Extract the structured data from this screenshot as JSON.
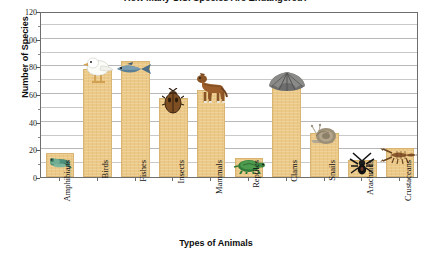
{
  "chart_data": {
    "type": "bar",
    "title": "How Many U.S. Species Are Endangered?",
    "xlabel": "Types of Animals",
    "ylabel": "Number of Species",
    "categories": [
      "Amphibians",
      "Birds",
      "Fishes",
      "Insects",
      "Mammals",
      "Reptiles",
      "Clams",
      "Snails",
      "Arachnids",
      "Crustaceans"
    ],
    "values": [
      17,
      78,
      84,
      57,
      63,
      14,
      70,
      32,
      12,
      21
    ],
    "ylim": [
      0,
      120
    ],
    "y_major_ticks": [
      0,
      20,
      40,
      60,
      80,
      100,
      120
    ],
    "y_tick_labels": [
      "0",
      "20",
      "40",
      "60",
      "80",
      "100",
      "120"
    ],
    "y_minor_tick_step": 10,
    "grid": "horizontal",
    "legend": "none",
    "bar_color": "#ecc987",
    "bar_edge_color": "#d9b573",
    "gridline_color": "#c9c9c9",
    "axis_color": "#6e6e6e",
    "background_color": "#ffffff",
    "icons": [
      {
        "category": "Amphibians",
        "icon_name": "frog-icon"
      },
      {
        "category": "Birds",
        "icon_name": "bird-icon"
      },
      {
        "category": "Fishes",
        "icon_name": "fish-icon"
      },
      {
        "category": "Insects",
        "icon_name": "beetle-icon"
      },
      {
        "category": "Mammals",
        "icon_name": "horse-icon"
      },
      {
        "category": "Reptiles",
        "icon_name": "turtle-icon"
      },
      {
        "category": "Clams",
        "icon_name": "clam-icon"
      },
      {
        "category": "Snails",
        "icon_name": "snail-icon"
      },
      {
        "category": "Arachnids",
        "icon_name": "spider-icon"
      },
      {
        "category": "Crustaceans",
        "icon_name": "crayfish-icon"
      }
    ]
  }
}
